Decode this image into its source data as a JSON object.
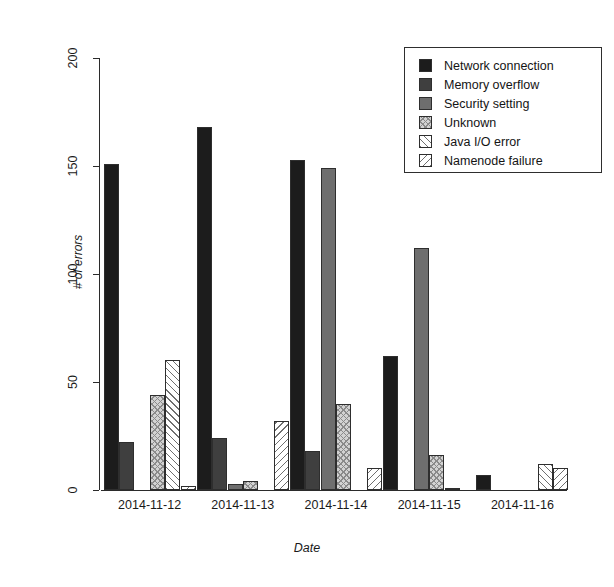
{
  "chart_data": {
    "type": "bar",
    "title": "",
    "xlabel": "Date",
    "ylabel": "# of errors",
    "categories": [
      "2014-11-12",
      "2014-11-13",
      "2014-11-14",
      "2014-11-15",
      "2014-11-16"
    ],
    "ylim": [
      0,
      200
    ],
    "yticks": [
      0,
      50,
      100,
      150,
      200
    ],
    "grid": false,
    "legend_position": "top-right",
    "series": [
      {
        "name": "Network connection",
        "color": "#1c1c1c",
        "pattern": "solid-black",
        "values": [
          151,
          168,
          153,
          62,
          7
        ]
      },
      {
        "name": "Memory overflow",
        "color": "#3f3f3f",
        "pattern": "solid-dark-gray",
        "values": [
          22,
          24,
          18,
          0,
          0
        ]
      },
      {
        "name": "Security setting",
        "color": "#6e6e6e",
        "pattern": "solid-mid-gray",
        "values": [
          0,
          3,
          149,
          112,
          0
        ]
      },
      {
        "name": "Unknown",
        "color": "#d2d2d2",
        "pattern": "cross-hatch",
        "values": [
          44,
          4,
          40,
          16,
          0
        ]
      },
      {
        "name": "Java I/O error",
        "color": "#ffffff",
        "pattern": "diagonal-hatch-up",
        "values": [
          60,
          0,
          0,
          1,
          12
        ]
      },
      {
        "name": "Namenode failure",
        "color": "#ffffff",
        "pattern": "diagonal-hatch-down",
        "values": [
          2,
          32,
          10,
          0,
          10
        ]
      }
    ]
  },
  "legend": {
    "items": [
      {
        "label": "Network connection"
      },
      {
        "label": "Memory overflow"
      },
      {
        "label": "Security setting"
      },
      {
        "label": "Unknown"
      },
      {
        "label": "Java I/O error"
      },
      {
        "label": "Namenode failure"
      }
    ]
  },
  "axes": {
    "y_title": "# of errors",
    "x_title": "Date",
    "y_tick_labels": [
      "0",
      "50",
      "100",
      "150",
      "200"
    ],
    "x_tick_labels": [
      "2014-11-12",
      "2014-11-13",
      "2014-11-14",
      "2014-11-15",
      "2014-11-16"
    ]
  }
}
